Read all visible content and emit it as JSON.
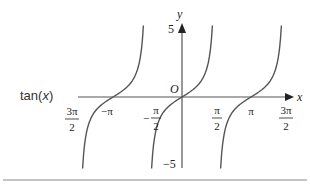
{
  "label": {
    "prefix": "tan(",
    "var": "x",
    "suffix": ")"
  },
  "axes": {
    "x_label": "x",
    "y_label": "y",
    "origin_label": "O",
    "y_max_label": "5",
    "y_min_label": "−5"
  },
  "x_ticks": [
    {
      "num": "3π",
      "den": "2",
      "neg": true
    },
    {
      "text": "−π"
    },
    {
      "num": "π",
      "den": "2",
      "neg": true
    },
    {
      "num": "π",
      "den": "2",
      "neg": false
    },
    {
      "text": "π"
    },
    {
      "num": "3π",
      "den": "2",
      "neg": false
    }
  ],
  "colors": {
    "curve": "#555555",
    "axis": "#555555",
    "rule": "#888888"
  },
  "chart_data": {
    "type": "line",
    "title": "tan(x)",
    "function": "y = tan(x)",
    "xlabel": "x",
    "ylabel": "y",
    "xlim": [
      -4.712,
      4.712
    ],
    "ylim": [
      -5,
      5
    ],
    "x_tick_labels": [
      "−3π/2",
      "−π",
      "−π/2",
      "π/2",
      "π",
      "3π/2"
    ],
    "y_tick_labels": [
      "5",
      "−5"
    ],
    "branches": [
      {
        "domain": [
          -4.712,
          -1.571
        ],
        "passes_through": [
          -3.1416,
          0
        ]
      },
      {
        "domain": [
          -1.571,
          1.571
        ],
        "passes_through": [
          0,
          0
        ]
      },
      {
        "domain": [
          1.571,
          4.712
        ],
        "passes_through": [
          3.1416,
          0
        ]
      }
    ],
    "grid": false
  }
}
